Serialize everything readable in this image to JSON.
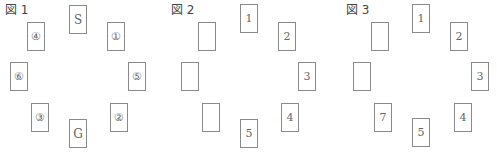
{
  "figures": [
    {
      "label": "図 1",
      "cards": [
        {
          "pos": "top",
          "text": "S"
        },
        {
          "pos": "top-right",
          "text": "①"
        },
        {
          "pos": "right",
          "text": "⑤"
        },
        {
          "pos": "bottom-right",
          "text": "②"
        },
        {
          "pos": "bottom",
          "text": "G"
        },
        {
          "pos": "bottom-left",
          "text": "③"
        },
        {
          "pos": "left",
          "text": "⑥"
        },
        {
          "pos": "top-left",
          "text": "④"
        }
      ]
    },
    {
      "label": "図 2",
      "cards": [
        {
          "pos": "top",
          "text": "1"
        },
        {
          "pos": "top-right",
          "text": "2"
        },
        {
          "pos": "right",
          "text": "3"
        },
        {
          "pos": "bottom-right",
          "text": "4"
        },
        {
          "pos": "bottom",
          "text": "5"
        },
        {
          "pos": "bottom-left",
          "text": ""
        },
        {
          "pos": "left",
          "text": ""
        },
        {
          "pos": "top-left",
          "text": ""
        }
      ]
    },
    {
      "label": "図 3",
      "cards": [
        {
          "pos": "top",
          "text": "1"
        },
        {
          "pos": "top-right",
          "text": "2"
        },
        {
          "pos": "right",
          "text": "3"
        },
        {
          "pos": "bottom-right",
          "text": "4"
        },
        {
          "pos": "bottom",
          "text": "5"
        },
        {
          "pos": "bottom-left",
          "text": "7"
        },
        {
          "pos": "left",
          "text": ""
        },
        {
          "pos": "top-left",
          "text": ""
        }
      ]
    }
  ]
}
